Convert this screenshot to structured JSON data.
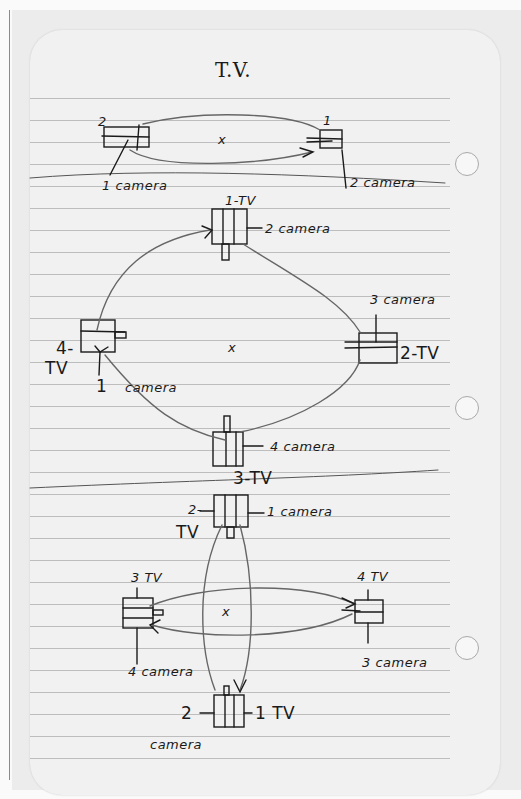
{
  "page": {
    "type": "handwritten notebook page",
    "paper_color": "#f1f1f1",
    "ink_color": "#1a1a1a",
    "title": "T.V."
  },
  "diagram_1": {
    "center_mark": "x",
    "left_unit": {
      "number_label": "2",
      "camera_label": "1 camera"
    },
    "right_unit": {
      "number_label": "1",
      "camera_label": "2 camera"
    }
  },
  "diagram_2": {
    "center_mark": "x",
    "top_unit": {
      "tv_label": "1-TV",
      "camera_label": "2 camera"
    },
    "right_unit": {
      "tv_label": "2-TV",
      "camera_label": "3 camera"
    },
    "bottom_unit": {
      "tv_label": "3-TV",
      "camera_label": "4 camera"
    },
    "left_unit": {
      "tv_label_num": "4-",
      "tv_label": "TV",
      "camera_num": "1",
      "camera_label": "camera"
    }
  },
  "diagram_3": {
    "center_mark": "x",
    "top_unit": {
      "tv_num": "2-",
      "tv_label": "TV",
      "camera_label": "1 camera"
    },
    "left_unit": {
      "tv_label": "3 TV",
      "camera_label": "4 camera"
    },
    "right_unit": {
      "tv_label": "4 TV",
      "camera_label": "3 camera"
    },
    "bottom_unit": {
      "camera_num": "2",
      "camera_label": "camera",
      "tv_label": "1 TV"
    }
  }
}
